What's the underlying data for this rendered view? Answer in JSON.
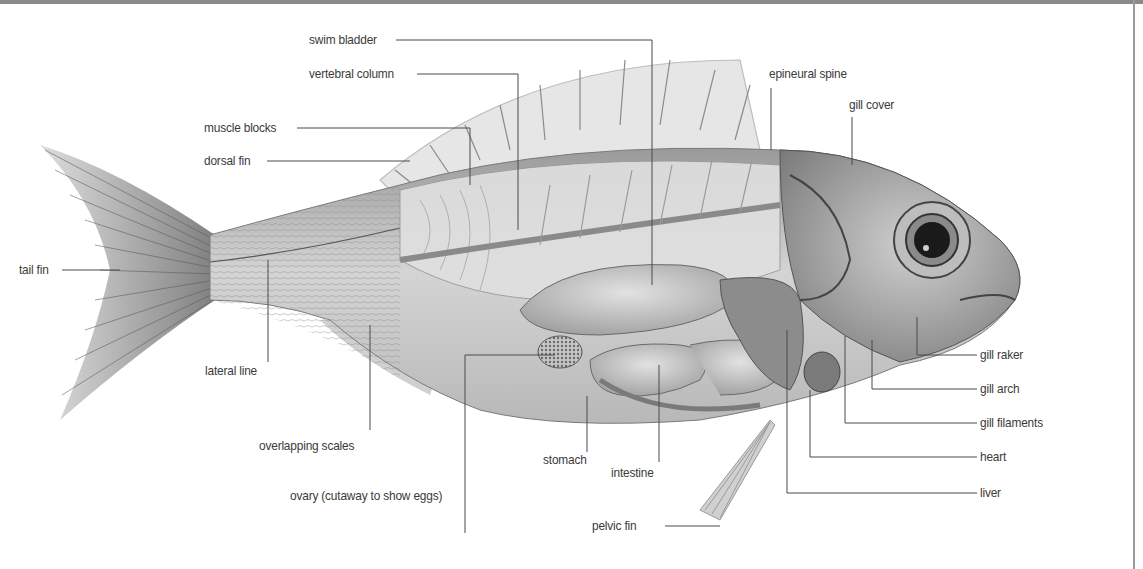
{
  "diagram": {
    "labels": {
      "swim_bladder": "swim bladder",
      "vertebral_column": "vertebral column",
      "muscle_blocks": "muscle blocks",
      "dorsal_fin": "dorsal fin",
      "epineural_spine": "epineural spine",
      "gill_cover": "gill cover",
      "tail_fin": "tail fin",
      "lateral_line": "lateral line",
      "overlapping_scales": "overlapping scales",
      "ovary": "ovary (cutaway to show eggs)",
      "stomach": "stomach",
      "intestine": "intestine",
      "pelvic_fin": "pelvic fin",
      "gill_raker": "gill raker",
      "gill_arch": "gill arch",
      "gill_filaments": "gill filaments",
      "heart": "heart",
      "liver": "liver"
    },
    "colors": {
      "background": "#ffffff",
      "label_text": "#3a3a3a",
      "leader_line": "#4a4a4a",
      "top_border": "#8a8a8a"
    }
  }
}
